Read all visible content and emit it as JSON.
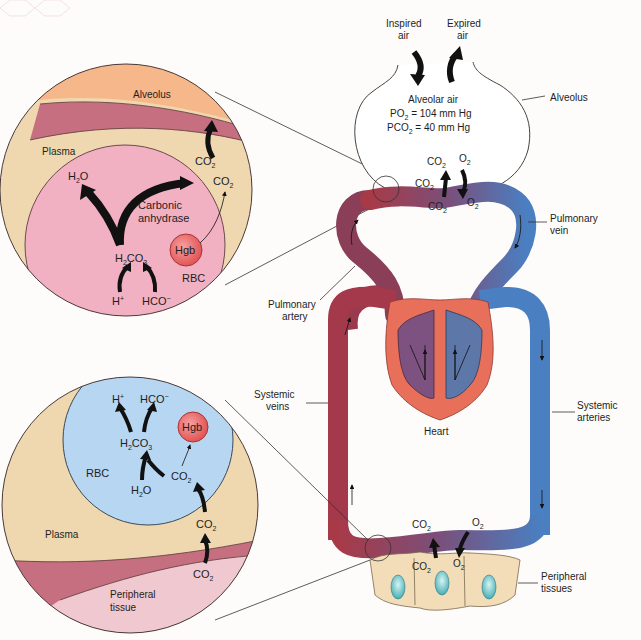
{
  "colors": {
    "background": "#fdfcfa",
    "alveolus_fill": "#f6b88a",
    "plasma_fill": "#efd8b0",
    "membrane_fill": "#c56f80",
    "rbc_pink_fill": "#f2b0c3",
    "rbc_blue_fill": "#b7d6f2",
    "hgb_fill": "#ef6e6e",
    "tissue_fill": "#f0c8cf",
    "venous_red": "#a83a48",
    "arterial_blue": "#4a7fc1",
    "heart_fill": "#e8705a",
    "cells_fill": "#f2ddb8",
    "nucleus_fill": "#7dd0d4"
  },
  "top_circle": {
    "alveolus_label": "Alveolus",
    "plasma_label": "Plasma",
    "co2_top": "CO",
    "co2_plasma": "CO",
    "h2o": "H",
    "enzyme_line1": "Carbonic",
    "enzyme_line2": "anhydrase",
    "hgb": "Hgb",
    "h2co3": "H",
    "rbc": "RBC",
    "h_plus": "H",
    "hco3": "HCO"
  },
  "bottom_circle": {
    "h_plus": "H",
    "hco3": "HCO",
    "hgb": "Hgb",
    "h2co3": "H",
    "rbc": "RBC",
    "co2_rbc": "CO",
    "h2o": "H",
    "plasma_label": "Plasma",
    "co2_plasma": "CO",
    "co2_tissue": "CO",
    "tissue_line1": "Peripheral",
    "tissue_line2": "tissue"
  },
  "lung": {
    "inspired_line1": "Inspired",
    "inspired_line2": "air",
    "expired_line1": "Expired",
    "expired_line2": "air",
    "alveolar_air": "Alveolar air",
    "po2": "PO",
    "po2_value": " = 104 mm Hg",
    "pco2": "PCO",
    "pco2_value": " = 40 mm Hg",
    "alveolus_label": "Alveolus",
    "co2_out": "CO",
    "o2_in": "O",
    "co2_vessel_left": "CO",
    "co2_vessel": "CO",
    "o2_vessel": "O"
  },
  "circulation": {
    "pulmonary_vein_line1": "Pulmonary",
    "pulmonary_vein_line2": "vein",
    "pulmonary_artery_line1": "Pulmonary",
    "pulmonary_artery_line2": "artery",
    "systemic_veins_line1": "Systemic",
    "systemic_veins_line2": "veins",
    "systemic_arteries_line1": "Systemic",
    "systemic_arteries_line2": "arteries",
    "heart": "Heart"
  },
  "periphery": {
    "co2_vessel": "CO",
    "o2_vessel": "O",
    "co2_tissue": "CO",
    "o2_tissue": "O",
    "tissues_line1": "Peripheral",
    "tissues_line2": "tissues"
  },
  "subscripts": {
    "two": "2",
    "three": "3",
    "plus": "+",
    "minus": "−"
  }
}
